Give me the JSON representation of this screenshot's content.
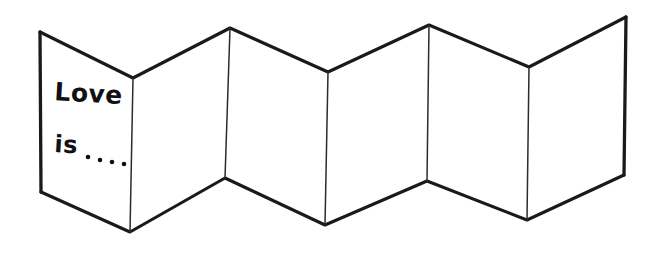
{
  "image": {
    "kind": "line-drawing",
    "subject": "accordion-folded-greeting-card",
    "background_color": "#ffffff",
    "ink_color": "#1a1a1a",
    "width": 658,
    "height": 255
  },
  "card": {
    "panel_count": 6,
    "front_panel": {
      "line1": "Love",
      "line2": "is",
      "ellipsis_dots": 4
    }
  },
  "geometry": {
    "top_vertices": [
      [
        40,
        32
      ],
      [
        133,
        78
      ],
      [
        230,
        28
      ],
      [
        328,
        72
      ],
      [
        429,
        25
      ],
      [
        529,
        67
      ],
      [
        626,
        17
      ]
    ],
    "bottom_vertices": [
      [
        41,
        192
      ],
      [
        130,
        232
      ],
      [
        225,
        178
      ],
      [
        325,
        225
      ],
      [
        427,
        181
      ],
      [
        527,
        220
      ],
      [
        624,
        175
      ]
    ],
    "creases": [
      [
        [
          133,
          78
        ],
        [
          130,
          232
        ]
      ],
      [
        [
          230,
          28
        ],
        [
          225,
          178
        ]
      ],
      [
        [
          328,
          72
        ],
        [
          325,
          225
        ]
      ],
      [
        [
          429,
          25
        ],
        [
          427,
          181
        ]
      ],
      [
        [
          529,
          67
        ],
        [
          527,
          220
        ]
      ]
    ],
    "left_edge": [
      [
        40,
        32
      ],
      [
        41,
        192
      ]
    ],
    "right_edge": [
      [
        626,
        17
      ],
      [
        624,
        175
      ]
    ]
  },
  "text_layout": {
    "love_position": [
      54,
      100
    ],
    "is_position": [
      54,
      152
    ],
    "dots": [
      [
        88,
        157
      ],
      [
        100,
        160
      ],
      [
        112,
        162
      ],
      [
        124,
        164
      ]
    ],
    "dot_radius": 2.3
  }
}
